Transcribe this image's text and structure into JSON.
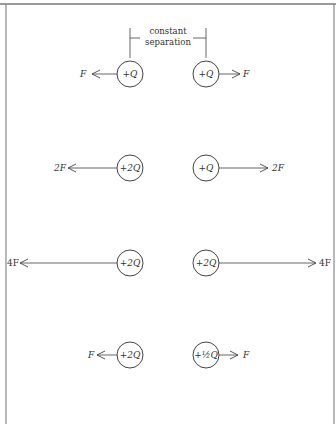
{
  "diagram": {
    "annotation": {
      "line1": "constant",
      "line2": "separation"
    },
    "rows": [
      {
        "left_charge": "+Q",
        "right_charge": "+Q",
        "left_force": "F",
        "right_force": "F"
      },
      {
        "left_charge": "+2Q",
        "right_charge": "+Q",
        "left_force": "2F",
        "right_force": "2F"
      },
      {
        "left_charge": "+2Q",
        "right_charge": "+2Q",
        "left_force": "4F",
        "right_force": "4F"
      },
      {
        "left_charge": "+2Q",
        "right_charge": "+½Q",
        "left_force": "F",
        "right_force": "F"
      }
    ],
    "colors": {
      "ink": "#333333",
      "border": "#888888",
      "background": "#ffffff"
    }
  }
}
